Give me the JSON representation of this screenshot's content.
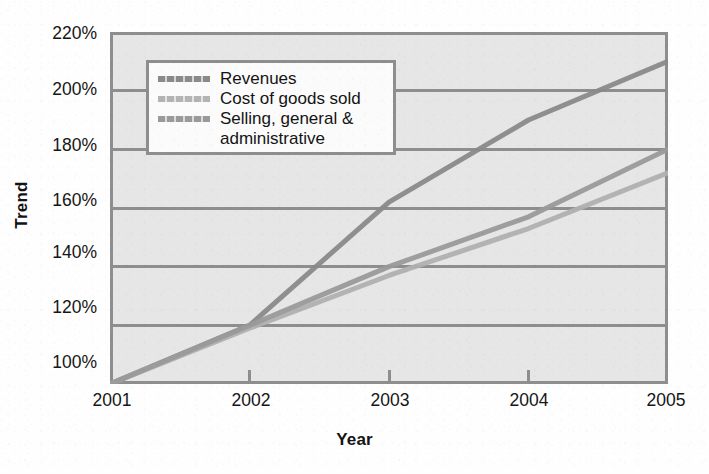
{
  "chart_data": {
    "type": "line",
    "title": "",
    "xlabel": "Year",
    "ylabel": "Trend",
    "categories": [
      "2001",
      "2002",
      "2003",
      "2004",
      "2005"
    ],
    "x": [
      2001,
      2002,
      2003,
      2004,
      2005
    ],
    "ylim": [
      100,
      220
    ],
    "xlim": [
      2001,
      2005
    ],
    "ytick_labels": [
      "220%",
      "200%",
      "180%",
      "160%",
      "140%",
      "120%",
      "100%"
    ],
    "ytick_values": [
      220,
      200,
      180,
      160,
      140,
      120,
      100
    ],
    "yunit": "%",
    "grid": "horizontal",
    "legend_position": "top-left",
    "plot_background": "#e6e6e6",
    "series": [
      {
        "name": "Revenues",
        "color": "#8a8a8a",
        "values": [
          100,
          120,
          162,
          190,
          210
        ]
      },
      {
        "name": "Cost of goods sold",
        "color": "#b0b0b0",
        "values": [
          100,
          119,
          137,
          153,
          172
        ]
      },
      {
        "name": "Selling, general & administrative",
        "color": "#9a9a9a",
        "values": [
          100,
          120,
          140,
          157,
          180
        ]
      }
    ]
  },
  "legend": {
    "items": [
      {
        "label": "Revenues",
        "label_cont": "",
        "color": "#8a8a8a"
      },
      {
        "label": "Cost of goods sold",
        "label_cont": "",
        "color": "#b4b4b4"
      },
      {
        "label": "Selling, general &",
        "label_cont": "administrative",
        "color": "#9a9a9a"
      }
    ]
  },
  "axes": {
    "y_title": "Trend",
    "x_title": "Year",
    "y_ticks": [
      "220%",
      "200%",
      "180%",
      "160%",
      "140%",
      "120%",
      "100%"
    ],
    "x_ticks": [
      "2001",
      "2002",
      "2003",
      "2004",
      "2005"
    ]
  },
  "colors": {
    "axis_line": "#8e8e8e",
    "grid_line": "#8e8e8e",
    "plot_bg": "#e6e6e6",
    "text": "#141414"
  }
}
